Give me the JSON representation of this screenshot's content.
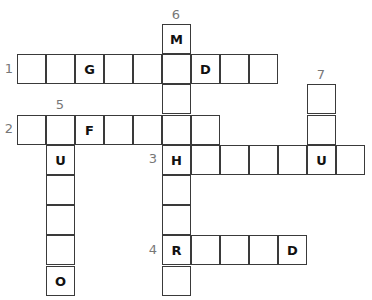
{
  "puzzle": {
    "type": "crossword",
    "cell_size": 29,
    "origin": {
      "x": 17,
      "y": 24
    },
    "row_height": 30.2,
    "clues": [
      {
        "number": "1",
        "direction": "across",
        "row": 1,
        "col": 0,
        "length": 9,
        "letters": [
          "",
          "",
          "G",
          "",
          "",
          "",
          "D",
          "",
          ""
        ],
        "label_pos": {
          "x": 2,
          "y": 61
        }
      },
      {
        "number": "2",
        "direction": "across",
        "row": 3,
        "col": 0,
        "length": 7,
        "letters": [
          "",
          "",
          "F",
          "",
          "",
          "",
          ""
        ],
        "label_pos": {
          "x": 2,
          "y": 121
        }
      },
      {
        "number": "3",
        "direction": "across",
        "row": 4,
        "col": 5,
        "length": 7,
        "letters": [
          "H",
          "",
          "",
          "",
          "",
          "U",
          ""
        ],
        "label_pos": {
          "x": 146,
          "y": 151
        }
      },
      {
        "number": "4",
        "direction": "across",
        "row": 7,
        "col": 5,
        "length": 5,
        "letters": [
          "R",
          "",
          "",
          "",
          "D"
        ],
        "label_pos": {
          "x": 146,
          "y": 242
        }
      },
      {
        "number": "5",
        "direction": "down",
        "row": 3,
        "col": 1,
        "length": 6,
        "letters": [
          "",
          "U",
          "",
          "",
          "",
          "O"
        ],
        "label_pos": {
          "x": 53,
          "y": 97
        }
      },
      {
        "number": "6",
        "direction": "down",
        "row": 0,
        "col": 5,
        "length": 9,
        "letters": [
          "M",
          "",
          "",
          "",
          "H",
          "",
          "",
          "R",
          ""
        ],
        "label_pos": {
          "x": 169,
          "y": 7
        }
      },
      {
        "number": "7",
        "direction": "down",
        "row": 2,
        "col": 10,
        "length": 3,
        "letters": [
          "",
          "",
          "U"
        ],
        "label_pos": {
          "x": 314,
          "y": 67
        }
      }
    ]
  }
}
